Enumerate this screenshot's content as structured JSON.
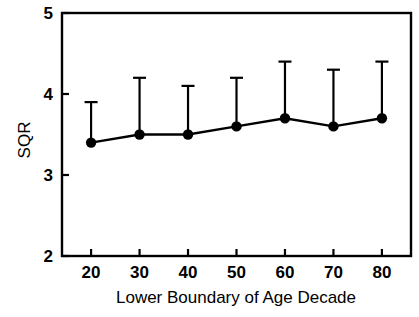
{
  "chart_data": {
    "type": "line",
    "title": "",
    "subtitle": "",
    "xlabel": "Lower Boundary of Age Decade",
    "ylabel": "SQR",
    "x": [
      20,
      30,
      40,
      50,
      60,
      70,
      80
    ],
    "categories": [
      "20",
      "30",
      "40",
      "50",
      "60",
      "70",
      "80"
    ],
    "values": [
      3.4,
      3.5,
      3.5,
      3.6,
      3.7,
      3.6,
      3.7
    ],
    "error_upper": [
      3.9,
      4.2,
      4.1,
      4.2,
      4.4,
      4.3,
      4.4
    ],
    "series": [
      {
        "name": "SQR",
        "values": [
          3.4,
          3.5,
          3.5,
          3.6,
          3.7,
          3.6,
          3.7
        ],
        "error_upper": [
          3.9,
          4.2,
          4.1,
          4.2,
          4.4,
          4.3,
          4.4
        ],
        "marker": "filled-circle",
        "color": "#000000"
      }
    ],
    "xlim": [
      14,
      86
    ],
    "ylim": [
      2,
      5
    ],
    "xticks": [
      20,
      30,
      40,
      50,
      60,
      70,
      80
    ],
    "yticks": [
      2,
      3,
      4,
      5
    ],
    "xtick_labels": [
      "20",
      "30",
      "40",
      "50",
      "60",
      "70",
      "80"
    ],
    "ytick_labels": [
      "2",
      "3",
      "4",
      "5"
    ],
    "grid": false,
    "legend": false,
    "legend_position": "none",
    "errorbar_style": "upper-only-with-cap",
    "annotations": []
  },
  "style": {
    "background": "#ffffff",
    "axis_color": "#000000",
    "series_color": "#000000",
    "plot_border": "#000000"
  }
}
